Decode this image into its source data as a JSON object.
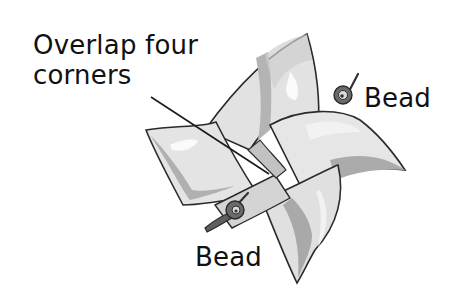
{
  "diagram": {
    "labels": {
      "overlap_line1": "Overlap four",
      "overlap_line2": "corners",
      "bead_right": "Bead",
      "bead_bottom": "Bead"
    },
    "colors": {
      "ink": "#222222",
      "paper_light": "#e4e4e4",
      "paper_mid": "#c8c8c8",
      "paper_dark": "#a6a6a6",
      "highlight": "#f7f7f7",
      "bead": "#6a6a6a"
    }
  }
}
